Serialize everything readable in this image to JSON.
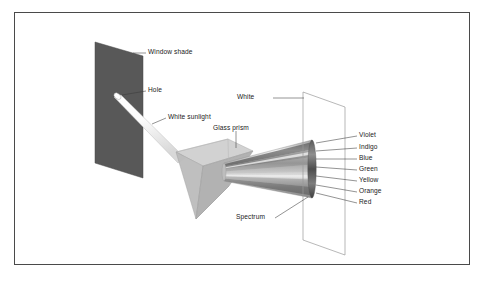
{
  "figure": {
    "background_color": "#ffffff",
    "frame_color": "#4a4a4a",
    "render_style": "grayscale line drawing"
  },
  "labels": {
    "window_shade": "Window shade",
    "hole": "Hole",
    "white_sunlight": "White sunlight",
    "glass_prism": "Glass prism",
    "white": "White",
    "spectrum": "Spectrum"
  },
  "spectrum_colors": [
    {
      "name": "Violet",
      "shade": "#3c3c3c"
    },
    {
      "name": "Indigo",
      "shade": "#4f4f4f"
    },
    {
      "name": "Blue",
      "shade": "#636363"
    },
    {
      "name": "Green",
      "shade": "#7a7a7a"
    },
    {
      "name": "Yellow",
      "shade": "#8f8f8f"
    },
    {
      "name": "Orange",
      "shade": "#6d6d6d"
    },
    {
      "name": "Red",
      "shade": "#505050"
    }
  ],
  "objects": {
    "window_shade": {
      "fill": "#585858",
      "shape": "parallelogram"
    },
    "glass_prism": {
      "top_face": "#d0d0d0",
      "left_face": "#bcbcbc",
      "right_face": "#a8a8a8"
    },
    "sunlight_beam": {
      "fill": "#fbfbfb",
      "shape": "cylinder"
    },
    "screen": {
      "fill": "none",
      "stroke": "#9a9a9a",
      "shape": "parallelogram"
    }
  }
}
